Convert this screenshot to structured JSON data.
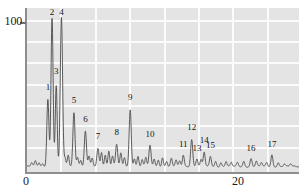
{
  "figure": {
    "kind": "chromatogram",
    "background_color": "#e4e4e4",
    "grid_color": "#fbfbfb",
    "trace_color": "#4a4a4a",
    "axis_color": "#8e8e8e"
  },
  "axes": {
    "y_tick_label": "100",
    "x_tick_labels": [
      "0",
      "20"
    ],
    "x_axis_title": "",
    "y_axis_title": ""
  },
  "chart_data": {
    "type": "line",
    "title": "",
    "subtitle": "",
    "xlabel": "",
    "ylabel": "",
    "xlim": [
      0,
      26.2
    ],
    "ylim": [
      0,
      122
    ],
    "grid": true,
    "legend": null,
    "x_ticks": [
      0,
      20
    ],
    "y_ticks": [
      100
    ],
    "x_gridlines": [
      3.3,
      6.6,
      9.9,
      13.2,
      16.5,
      19.8,
      23.1,
      26.2
    ],
    "y_gridlines": [
      16,
      33,
      49,
      65,
      82,
      98,
      114
    ],
    "annotations": [
      {
        "label": "1",
        "x": 2.1,
        "y": 58
      },
      {
        "label": "2",
        "x": 2.5,
        "y": 120
      },
      {
        "label": "3",
        "x": 2.9,
        "y": 70
      },
      {
        "label": "4",
        "x": 3.4,
        "y": 120
      },
      {
        "label": "5",
        "x": 4.6,
        "y": 48
      },
      {
        "label": "6",
        "x": 5.7,
        "y": 33
      },
      {
        "label": "7",
        "x": 6.9,
        "y": 20
      },
      {
        "label": "8",
        "x": 8.7,
        "y": 23
      },
      {
        "label": "9",
        "x": 10.0,
        "y": 50
      },
      {
        "label": "10",
        "x": 11.9,
        "y": 22
      },
      {
        "label": "11",
        "x": 15.1,
        "y": 14
      },
      {
        "label": "12",
        "x": 15.9,
        "y": 27
      },
      {
        "label": "13",
        "x": 16.4,
        "y": 11
      },
      {
        "label": "14",
        "x": 17.1,
        "y": 17
      },
      {
        "label": "15",
        "x": 17.7,
        "y": 13
      },
      {
        "label": "16",
        "x": 21.6,
        "y": 11
      },
      {
        "label": "17",
        "x": 23.6,
        "y": 14
      }
    ],
    "peaks": [
      {
        "id": 1,
        "x": 2.1,
        "height": 52,
        "width": 0.1
      },
      {
        "id": 2,
        "x": 2.5,
        "height": 115,
        "width": 0.1
      },
      {
        "id": 3,
        "x": 2.9,
        "height": 62,
        "width": 0.09
      },
      {
        "id": 4,
        "x": 3.4,
        "height": 115,
        "width": 0.11
      },
      {
        "id": 5,
        "x": 4.6,
        "height": 42,
        "width": 0.1
      },
      {
        "id": 6,
        "x": 5.7,
        "height": 27,
        "width": 0.1
      },
      {
        "id": 7,
        "x": 6.9,
        "height": 14,
        "width": 0.1
      },
      {
        "id": 8,
        "x": 8.7,
        "height": 17,
        "width": 0.1
      },
      {
        "id": 9,
        "x": 10.0,
        "height": 44,
        "width": 0.1
      },
      {
        "id": 10,
        "x": 11.9,
        "height": 16,
        "width": 0.1
      },
      {
        "id": 11,
        "x": 15.1,
        "height": 9,
        "width": 0.09
      },
      {
        "id": 12,
        "x": 15.9,
        "height": 21,
        "width": 0.1
      },
      {
        "id": 13,
        "x": 16.4,
        "height": 6,
        "width": 0.09
      },
      {
        "id": 14,
        "x": 17.1,
        "height": 11,
        "width": 0.09
      },
      {
        "id": 15,
        "x": 17.7,
        "height": 8,
        "width": 0.09
      },
      {
        "id": 16,
        "x": 21.6,
        "height": 6,
        "width": 0.09
      },
      {
        "id": 17,
        "x": 23.6,
        "height": 9,
        "width": 0.09
      }
    ],
    "minor_peaks": [
      {
        "x": 0.55,
        "height": 3
      },
      {
        "x": 0.9,
        "height": 4
      },
      {
        "x": 1.25,
        "height": 3
      },
      {
        "x": 1.6,
        "height": 2
      },
      {
        "x": 3.75,
        "height": 6
      },
      {
        "x": 4.05,
        "height": 9
      },
      {
        "x": 4.95,
        "height": 7
      },
      {
        "x": 5.25,
        "height": 5
      },
      {
        "x": 6.05,
        "height": 8
      },
      {
        "x": 6.35,
        "height": 6
      },
      {
        "x": 7.25,
        "height": 11
      },
      {
        "x": 7.6,
        "height": 9
      },
      {
        "x": 7.95,
        "height": 12
      },
      {
        "x": 8.3,
        "height": 8
      },
      {
        "x": 9.1,
        "height": 10
      },
      {
        "x": 9.45,
        "height": 7
      },
      {
        "x": 10.4,
        "height": 6
      },
      {
        "x": 10.75,
        "height": 8
      },
      {
        "x": 11.15,
        "height": 5
      },
      {
        "x": 11.5,
        "height": 7
      },
      {
        "x": 12.3,
        "height": 6
      },
      {
        "x": 12.7,
        "height": 5
      },
      {
        "x": 13.1,
        "height": 7
      },
      {
        "x": 13.5,
        "height": 4
      },
      {
        "x": 13.95,
        "height": 6
      },
      {
        "x": 14.4,
        "height": 5
      },
      {
        "x": 14.75,
        "height": 4
      },
      {
        "x": 16.8,
        "height": 5
      },
      {
        "x": 18.2,
        "height": 4
      },
      {
        "x": 18.7,
        "height": 3
      },
      {
        "x": 19.2,
        "height": 4
      },
      {
        "x": 19.7,
        "height": 3
      },
      {
        "x": 20.3,
        "height": 3
      },
      {
        "x": 20.9,
        "height": 4
      },
      {
        "x": 22.1,
        "height": 4
      },
      {
        "x": 22.6,
        "height": 3
      },
      {
        "x": 23.1,
        "height": 3
      },
      {
        "x": 24.2,
        "height": 3
      },
      {
        "x": 24.8,
        "height": 2
      },
      {
        "x": 25.4,
        "height": 2
      }
    ]
  }
}
